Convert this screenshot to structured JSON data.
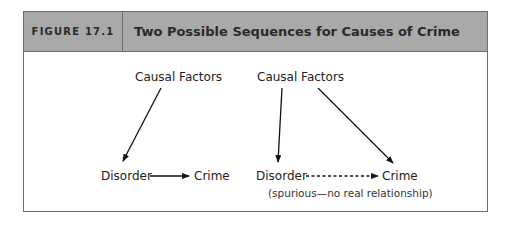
{
  "figure": {
    "label": "FIGURE 17.1",
    "title": "Two Possible Sequences for Causes of Crime",
    "header_color": "#a9a9a9",
    "border_color": "#6e6e6e"
  },
  "left_diagram": {
    "top_node": "Causal Factors",
    "bottom_left_node": "Disorder",
    "bottom_right_node": "Crime",
    "edges": [
      {
        "from": "Causal Factors",
        "to": "Disorder",
        "style": "solid"
      },
      {
        "from": "Disorder",
        "to": "Crime",
        "style": "solid"
      }
    ]
  },
  "right_diagram": {
    "top_node": "Causal Factors",
    "bottom_left_node": "Disorder",
    "bottom_right_node": "Crime",
    "note": "(spurious—no real relationship)",
    "edges": [
      {
        "from": "Causal Factors",
        "to": "Disorder",
        "style": "solid"
      },
      {
        "from": "Causal Factors",
        "to": "Crime",
        "style": "solid"
      },
      {
        "from": "Disorder",
        "to": "Crime",
        "style": "dashed"
      }
    ]
  }
}
